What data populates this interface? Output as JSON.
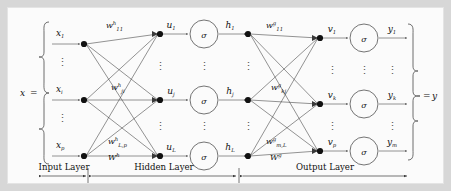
{
  "figure": {
    "kind": "neural-network-diagram",
    "title_visible": false,
    "background": "#fbfbfb",
    "page_background": "#d7d7d7",
    "line_color": "#3a3a3a",
    "node_color": "#111111"
  },
  "input_vector": {
    "label": "x",
    "equals": "=",
    "entries": [
      {
        "base": "x",
        "sub": "1"
      },
      {
        "base": "x",
        "sub": "i"
      },
      {
        "base": "x",
        "sub": "p"
      }
    ],
    "vertical_dots": "⋮"
  },
  "output_vector": {
    "equals": "=",
    "label": "y"
  },
  "hidden_layer": {
    "preactivations": [
      {
        "base": "u",
        "sub": "1"
      },
      {
        "base": "u",
        "sub": "j"
      },
      {
        "base": "u",
        "sub": "L"
      }
    ],
    "activation_symbol": "σ",
    "activations": [
      {
        "base": "h",
        "sub": "1"
      },
      {
        "base": "h",
        "sub": "j"
      },
      {
        "base": "h",
        "sub": "L"
      }
    ]
  },
  "output_layer": {
    "preactivations": [
      {
        "base": "v",
        "sub": "1"
      },
      {
        "base": "v",
        "sub": "k"
      },
      {
        "base": "v",
        "sub": "p"
      }
    ],
    "activation_symbol": "σ",
    "outputs": [
      {
        "base": "y",
        "sub": "1"
      },
      {
        "base": "y",
        "sub": "k"
      },
      {
        "base": "y",
        "sub": "m"
      }
    ]
  },
  "weights": {
    "hidden": [
      {
        "base": "w",
        "sup": "h",
        "sub": "11"
      },
      {
        "base": "w",
        "sup": "h",
        "sub": "ji"
      },
      {
        "base": "w",
        "sup": "h",
        "sub": "L,p"
      }
    ],
    "hidden_matrix": {
      "base": "W",
      "sup": "h"
    },
    "output": [
      {
        "base": "w",
        "sup": "g",
        "sub": "11"
      },
      {
        "base": "w",
        "sup": "g",
        "sub": "kj"
      },
      {
        "base": "w",
        "sup": "g",
        "sub": "m,L"
      }
    ],
    "output_matrix": {
      "base": "W",
      "sup": "g"
    }
  },
  "layer_captions": [
    {
      "name": "input",
      "label": "Input Layer"
    },
    {
      "name": "hidden",
      "label": "Hidden Layer"
    },
    {
      "name": "output",
      "label": "Output Layer"
    }
  ]
}
